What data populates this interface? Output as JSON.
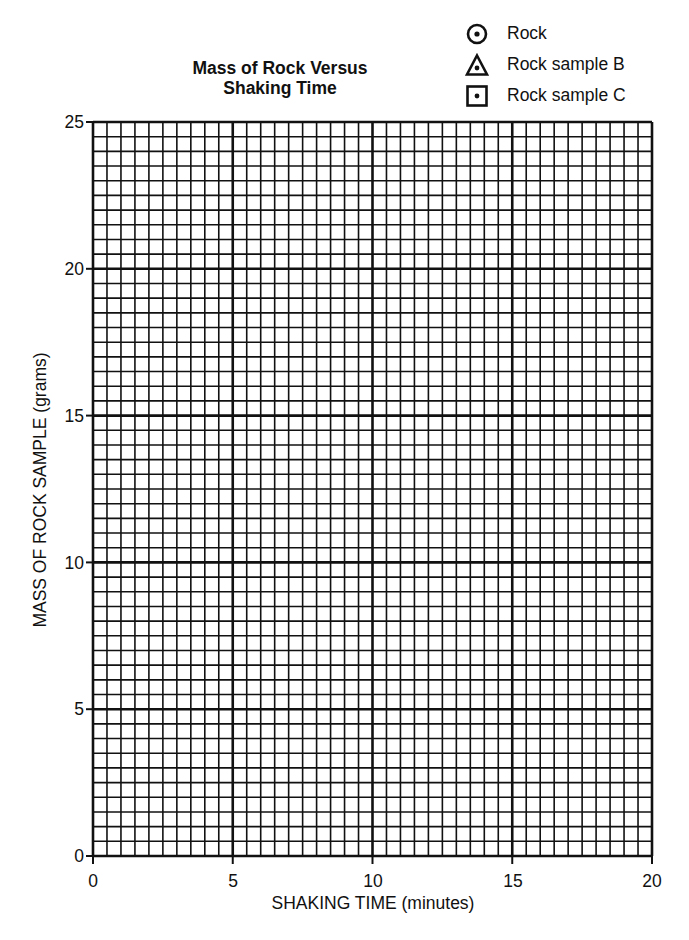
{
  "chart_data": {
    "type": "scatter",
    "title": "Mass of Rock Versus Shaking Time",
    "title_lines": [
      "Mass of Rock Versus",
      "Shaking Time"
    ],
    "xlabel": "SHAKING TIME (minutes)",
    "ylabel": "MASS OF ROCK SAMPLE (grams)",
    "xlim": [
      0,
      20
    ],
    "ylim": [
      0,
      25
    ],
    "x_ticks": [
      "0",
      "5",
      "10",
      "15",
      "20"
    ],
    "y_ticks": [
      "0",
      "5",
      "10",
      "15",
      "20",
      "25"
    ],
    "grid": {
      "on": true,
      "major_step_x": 5,
      "minor_step_x": 0.5,
      "major_step_y": 5,
      "minor_step_y": 0.5
    },
    "legend_position": "top-right",
    "series": [
      {
        "name": "Rock",
        "marker": "circle-dot",
        "values": []
      },
      {
        "name": "Rock sample B",
        "marker": "triangle-dot",
        "values": []
      },
      {
        "name": "Rock sample C",
        "marker": "square-dot",
        "values": []
      }
    ],
    "note": "Blank graph grid; no data points plotted"
  },
  "legend": {
    "items": [
      {
        "label": "Rock",
        "icon": "circle-dot-icon"
      },
      {
        "label": "Rock sample B",
        "icon": "triangle-dot-icon"
      },
      {
        "label": "Rock sample C",
        "icon": "square-dot-icon"
      }
    ]
  },
  "axes": {
    "x": {
      "label": "SHAKING TIME (minutes)",
      "ticks": [
        "0",
        "5",
        "10",
        "15",
        "20"
      ]
    },
    "y": {
      "label": "MASS OF ROCK SAMPLE (grams)",
      "ticks": [
        "0",
        "5",
        "10",
        "15",
        "20",
        "25"
      ]
    }
  },
  "colors": {
    "ink": "#111111",
    "paper": "#ffffff"
  }
}
